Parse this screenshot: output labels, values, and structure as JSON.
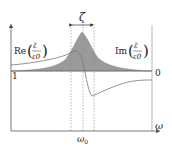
{
  "diagram": {
    "labels": {
      "re_prefix": "Re",
      "im_prefix": "Im",
      "fraction_num": "ε̃",
      "fraction_den": "ε0",
      "zeta": "ζ",
      "omega0": "ω0",
      "omega0_main": "ω",
      "omega0_sub": "0",
      "omega_axis": "ω",
      "left_tick": "1",
      "right_tick": "0"
    },
    "colors": {
      "axis": "#555555",
      "curve": "#777777",
      "fill": "#9a9a9a",
      "dashed": "#888888",
      "text": "#222222",
      "background": "#ffffff"
    },
    "series": [
      {
        "name": "Re(ε̃/ε0)",
        "style": "line",
        "axis": "left",
        "baseline_value": 1
      },
      {
        "name": "Im(ε̃/ε0)",
        "style": "filled-peak",
        "axis": "right",
        "baseline_value": 0
      }
    ],
    "markers": {
      "omega0_line": "center dashed line at resonance frequency ω0",
      "width_lines": "dashed lines bounding linewidth ζ",
      "zeta_arrow": "double-headed arrow indicating width ζ"
    }
  }
}
